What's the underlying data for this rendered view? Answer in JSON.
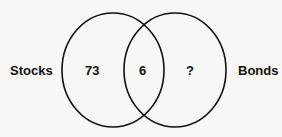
{
  "diagram": {
    "type": "venn",
    "sets": [
      {
        "label": "Stocks",
        "only_value": "73"
      },
      {
        "label": "Bonds",
        "only_value": "?"
      }
    ],
    "intersection_value": "6",
    "colors": {
      "stroke": "#111111",
      "background": "#f7f7f5"
    }
  }
}
